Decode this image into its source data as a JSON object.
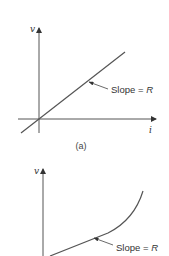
{
  "figure_a": {
    "y_axis_label": "v",
    "x_axis_label": "i",
    "annotation": {
      "text": "Slope = ",
      "symbol": "R"
    },
    "caption": "(a)",
    "relationship": "linear"
  },
  "figure_b": {
    "y_axis_label": "v",
    "annotation": {
      "text": "Slope = ",
      "symbol": "R"
    },
    "relationship": "nonlinear"
  },
  "colors": {
    "line": "#555555",
    "text": "#333333"
  }
}
